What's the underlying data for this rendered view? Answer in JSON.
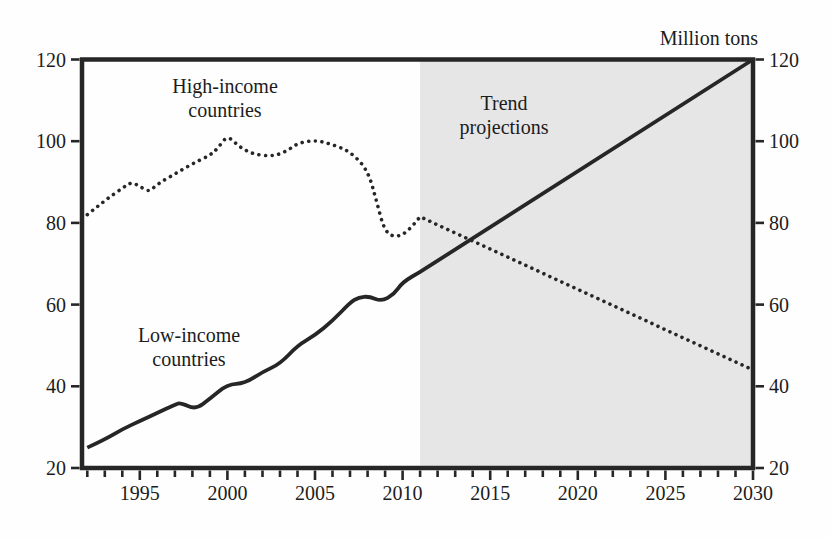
{
  "figure": {
    "unit_label": "Million tons"
  },
  "chart_data": {
    "type": "line",
    "title": "Million tons",
    "xlabel": "",
    "ylabel": "Million tons",
    "x_axis": {
      "min": 1991.7,
      "max": 2030,
      "major_ticks": [
        1995,
        2000,
        2005,
        2010,
        2015,
        2020,
        2025,
        2030
      ],
      "minor_tick_start": 1992,
      "minor_tick_step": 1,
      "grid": false
    },
    "y_axis": {
      "min": 20,
      "max": 120,
      "ticks": [
        20,
        40,
        60,
        80,
        100,
        120
      ],
      "label_sides": "both",
      "grid": false
    },
    "projection_region": {
      "start": 2011,
      "end": 2030,
      "fill": "#e6e6e6"
    },
    "line_color": "#262626",
    "series": [
      {
        "name": "High-income countries",
        "line_style": "dotted",
        "observed": {
          "x": [
            1992,
            1993,
            1994,
            1994.5,
            1995,
            1995.5,
            1996,
            1997,
            1998,
            1999,
            1999.5,
            2000,
            2000.7,
            2001.5,
            2002.5,
            2003.3,
            2004,
            2005,
            2006,
            2007,
            2008,
            2008.5,
            2009,
            2009.7,
            2010.3,
            2011
          ],
          "y": [
            82,
            85.5,
            88.5,
            90,
            89,
            87.5,
            89.5,
            92,
            94.5,
            96.5,
            98.5,
            101.5,
            98.5,
            96.8,
            96.3,
            97.3,
            99.5,
            100.3,
            99.2,
            97.5,
            93,
            85.5,
            77.5,
            76.5,
            78,
            81.5
          ]
        },
        "projection": {
          "x": [
            2011,
            2030
          ],
          "y": [
            81.5,
            44
          ]
        }
      },
      {
        "name": "Low-income countries",
        "line_style": "solid",
        "observed": {
          "x": [
            1992,
            1993,
            1994,
            1995,
            1996,
            1997,
            1997.3,
            1998.2,
            1999,
            2000,
            2001,
            2002,
            2003,
            2004,
            2005,
            2006,
            2007,
            2007.5,
            2008.1,
            2008.8,
            2009.5,
            2010,
            2011
          ],
          "y": [
            25,
            27,
            29.5,
            31.5,
            33.5,
            35.5,
            36,
            34.3,
            37,
            40.5,
            40.7,
            43.5,
            45.5,
            50,
            52.5,
            56,
            60.5,
            61.8,
            62,
            60.8,
            62.5,
            65.5,
            68
          ]
        },
        "projection": {
          "x": [
            2011,
            2030
          ],
          "y": [
            68,
            120
          ]
        }
      }
    ],
    "annotations": [
      {
        "id": "high_income",
        "text": "High-income\ncountries"
      },
      {
        "id": "trend",
        "text": "Trend\nprojections"
      },
      {
        "id": "low_income",
        "text": "Low-income\ncountries"
      }
    ]
  }
}
